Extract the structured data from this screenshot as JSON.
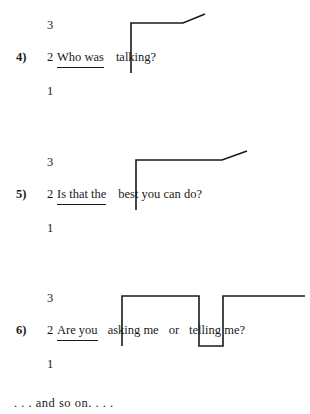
{
  "page": {
    "background": "#ffffff",
    "ink": "#1a1a1a",
    "trailing_note": ". . . and so on. . . ."
  },
  "pitch_levels": {
    "high": "3",
    "mid": "2",
    "low": "1"
  },
  "exercises": [
    {
      "number": "4)",
      "level_high": "3",
      "level_mid": "2",
      "level_low": "1",
      "chunks": [
        {
          "text": "Who was",
          "underlined": true
        },
        {
          "text": "talking?",
          "underlined": false
        }
      ],
      "contour_description": "low-level on 'Who was', step up to level 3 before 'talking?', then rising tail",
      "contour_points": "58,73 131,73 131,23 183,23 205,14"
    },
    {
      "number": "5)",
      "level_high": "3",
      "level_mid": "2",
      "level_low": "1",
      "chunks": [
        {
          "text": "Is that the",
          "underlined": true
        },
        {
          "text": "best you can do?",
          "underlined": false
        }
      ],
      "contour_description": "low-level on 'Is that the', step up to level 3 before 'best you can do?', then rising tail",
      "contour_points": "58,73 136,73 136,23 222,23 247,14"
    },
    {
      "number": "6)",
      "level_high": "3",
      "level_mid": "2",
      "level_low": "1",
      "chunks": [
        {
          "text": "Are you",
          "underlined": true
        },
        {
          "text": "asking me",
          "underlined": false
        },
        {
          "text": "or",
          "underlined": false
        },
        {
          "text": "telling me?",
          "underlined": false
        }
      ],
      "contour_description": "square-wave: low on 'Are you', high on 'asking me', low on 'or', high sustained on 'telling me?'",
      "contour_points": "58,73 122,73 122,23 199,23 199,73 223,73 223,23 305,23"
    }
  ]
}
